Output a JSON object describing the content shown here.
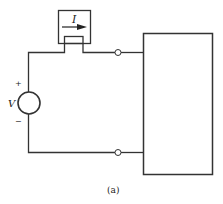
{
  "diagram": {
    "caption": "(a)",
    "source": {
      "label": "V",
      "plus": "+",
      "minus": "−"
    },
    "ammeter": {
      "label": "I",
      "arrow": "right-arrow"
    },
    "load": {
      "label": ""
    },
    "colors": {
      "line": "#333333",
      "background": "#ffffff"
    }
  }
}
